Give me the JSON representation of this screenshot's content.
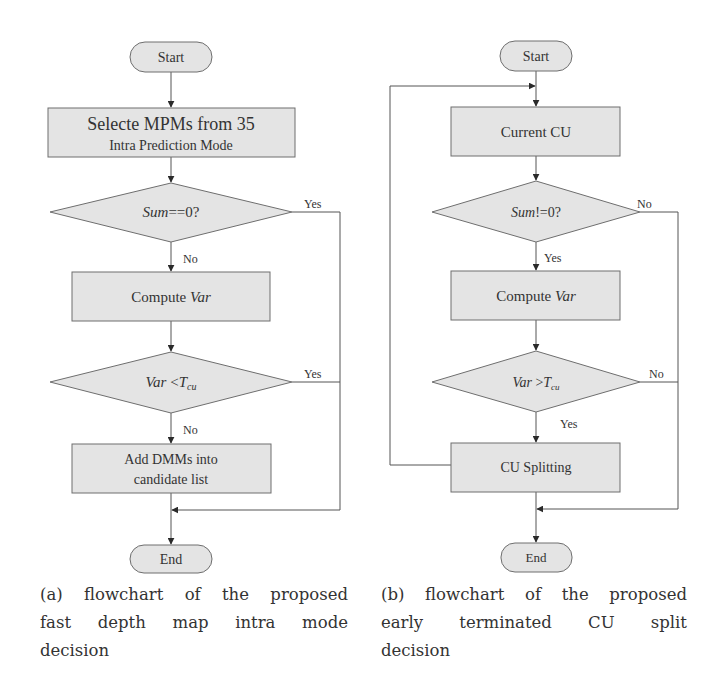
{
  "colors": {
    "node_fill": "#e4e4e4",
    "node_stroke": "#6e6e6e",
    "edge_stroke": "#555555",
    "text": "#333333",
    "background": "#ffffff"
  },
  "flowchart_a": {
    "start": "Start",
    "step1_line1": "Selecte MPMs from 35",
    "step1_line2": "Intra Prediction Mode",
    "decision1": {
      "var": "Sum",
      "rest": "==0?"
    },
    "decision1_yes": "Yes",
    "decision1_no": "No",
    "step2": {
      "prefix": "Compute ",
      "var": "Var"
    },
    "decision2": {
      "var": "Var",
      "op": " <",
      "sym": "T",
      "sub": "cu"
    },
    "decision2_yes": "Yes",
    "decision2_no": "No",
    "step3_line1": "Add DMMs into",
    "step3_line2": "candidate list",
    "end": "End",
    "caption_lines": [
      "(a) flowchart of the proposed",
      "fast depth map intra mode",
      "decision"
    ]
  },
  "flowchart_b": {
    "start": "Start",
    "step1": "Current CU",
    "decision1": {
      "var": "Sum",
      "rest": "!=0?"
    },
    "decision1_no": "No",
    "decision1_yes": "Yes",
    "step2": {
      "prefix": "Compute ",
      "var": "Var"
    },
    "decision2": {
      "var": "Var",
      "op": " >",
      "sym": "T",
      "sub": "cu"
    },
    "decision2_no": "No",
    "decision2_yes": "Yes",
    "step3": "CU Splitting",
    "end": "End",
    "caption_lines": [
      "(b) flowchart of the proposed",
      "early terminated CU split",
      "decision"
    ]
  }
}
